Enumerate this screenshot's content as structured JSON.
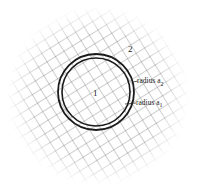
{
  "diagram": {
    "region_outer_label": "2",
    "region_inner_label": "1",
    "radius_outer_label": "radius a",
    "radius_outer_sub": "2",
    "radius_inner_label": "radius a",
    "radius_inner_sub": "1",
    "circle_center": [
      96,
      92
    ],
    "outer_radius": 38,
    "inner_radius": 34,
    "line_color": "#1a1a1a",
    "grid_color": "#555555"
  }
}
